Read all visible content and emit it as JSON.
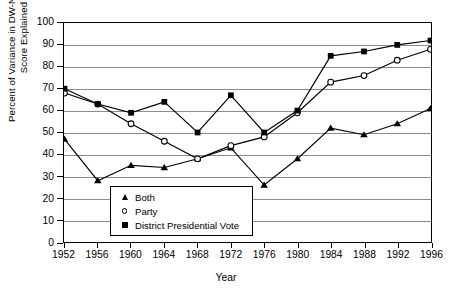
{
  "chart_data": {
    "type": "line",
    "title": "",
    "xlabel": "Year",
    "ylabel": "Percent of Variance in DW-NOMINATE\nScore Explained",
    "x": [
      1952,
      1956,
      1960,
      1964,
      1968,
      1972,
      1976,
      1980,
      1984,
      1988,
      1992,
      1996
    ],
    "categories": [
      "1952",
      "1956",
      "1960",
      "1964",
      "1968",
      "1972",
      "1976",
      "1980",
      "1984",
      "1988",
      "1992",
      "1996"
    ],
    "ylim": [
      0,
      100
    ],
    "yticks": [
      0,
      10,
      20,
      30,
      40,
      50,
      60,
      70,
      80,
      90,
      100
    ],
    "xlim": [
      1952,
      1996
    ],
    "grid": "horizontal",
    "legend_position": "inside-bottom-left",
    "series": [
      {
        "name": "Both",
        "marker": "filled-triangle",
        "values": [
          47,
          28,
          35,
          34,
          38,
          43,
          26,
          38,
          52,
          49,
          54,
          61
        ]
      },
      {
        "name": "Party",
        "marker": "open-circle",
        "values": [
          68,
          63,
          54,
          46,
          38,
          44,
          48,
          59,
          73,
          76,
          83,
          88
        ]
      },
      {
        "name": "District Presidential Vote",
        "marker": "filled-square",
        "values": [
          70,
          63,
          59,
          64,
          50,
          67,
          50,
          60,
          85,
          87,
          90,
          92
        ]
      }
    ]
  },
  "axis": {
    "y_tick_labels": [
      "100",
      "90",
      "80",
      "70",
      "60",
      "50",
      "40",
      "30",
      "20",
      "10",
      "0"
    ],
    "x_tick_labels": [
      "1952",
      "1956",
      "1960",
      "1964",
      "1968",
      "1972",
      "1976",
      "1980",
      "1984",
      "1988",
      "1992",
      "1996"
    ],
    "y_title_line1": "Percent of Variance in DW-NOMINATE",
    "y_title_line2": "Score Explained",
    "x_title": "Year"
  },
  "legend": {
    "items": [
      {
        "label": "Both",
        "marker": "filled-triangle"
      },
      {
        "label": "Party",
        "marker": "open-circle"
      },
      {
        "label": "District Presidential Vote",
        "marker": "filled-square"
      }
    ]
  },
  "colors": {
    "line": "#000000",
    "grid": "#8c8c8c",
    "background": "#ffffff",
    "axis": "#000000"
  }
}
